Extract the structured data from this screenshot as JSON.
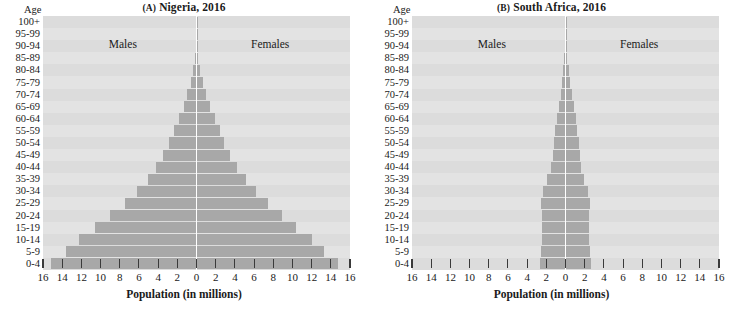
{
  "figure": {
    "x_axis_title": "Population (in millions)",
    "age_axis_title": "Age",
    "males_label": "Males",
    "females_label": "Females",
    "tick_labels": [
      "16",
      "14",
      "12",
      "10",
      "8",
      "6",
      "4",
      "2",
      "0",
      "2",
      "4",
      "6",
      "8",
      "10",
      "12",
      "14",
      "16"
    ],
    "tick_values": [
      -16,
      -14,
      -12,
      -10,
      -8,
      -6,
      -4,
      -2,
      0,
      2,
      4,
      6,
      8,
      10,
      12,
      14,
      16
    ],
    "age_groups": [
      "100+",
      "95-99",
      "90-94",
      "85-89",
      "80-84",
      "75-79",
      "70-74",
      "65-69",
      "60-64",
      "55-59",
      "50-54",
      "45-49",
      "40-44",
      "35-39",
      "30-34",
      "25-29",
      "20-24",
      "15-19",
      "10-14",
      "5-9",
      "0-4"
    ],
    "bar_color": "#a8a8a8",
    "row_color_a": "#dcdcdc",
    "row_color_b": "#e3e3e3",
    "centerline_color": "#ffffff"
  },
  "panels": [
    {
      "id": "nigeria",
      "label": "(A)",
      "title": "(A) Nigeria, 2016",
      "title_prefix": "(A)",
      "title_text": "Nigeria, 2016"
    },
    {
      "id": "south-africa",
      "label": "(B)",
      "title": "(B) South Africa, 2016",
      "title_prefix": "(B)",
      "title_text": "South Africa, 2016"
    }
  ],
  "chart_data": [
    {
      "type": "bar",
      "subtype": "population-pyramid",
      "title": "(A) Nigeria, 2016",
      "xlabel": "Population (in millions)",
      "ylabel": "Age",
      "xlim": [
        -16,
        16
      ],
      "xticks": [
        -16,
        -14,
        -12,
        -10,
        -8,
        -6,
        -4,
        -2,
        0,
        2,
        4,
        6,
        8,
        10,
        12,
        14,
        16
      ],
      "xticklabels": [
        "16",
        "14",
        "12",
        "10",
        "8",
        "6",
        "4",
        "2",
        "0",
        "2",
        "4",
        "6",
        "8",
        "10",
        "12",
        "14",
        "16"
      ],
      "grid": false,
      "legend": [
        "Males",
        "Females"
      ],
      "legend_position": "inside-top",
      "categories": [
        "100+",
        "95-99",
        "90-94",
        "85-89",
        "80-84",
        "75-79",
        "70-74",
        "65-69",
        "60-64",
        "55-59",
        "50-54",
        "45-49",
        "40-44",
        "35-39",
        "30-34",
        "25-29",
        "20-24",
        "15-19",
        "10-14",
        "5-9",
        "0-4"
      ],
      "series": [
        {
          "name": "Males",
          "values": [
            0.01,
            0.03,
            0.08,
            0.18,
            0.35,
            0.62,
            0.95,
            1.35,
            1.85,
            2.35,
            2.85,
            3.45,
            4.2,
            5.1,
            6.2,
            7.5,
            9.0,
            10.6,
            12.3,
            13.6,
            15.2
          ]
        },
        {
          "name": "Females",
          "values": [
            0.01,
            0.03,
            0.09,
            0.2,
            0.38,
            0.66,
            1.0,
            1.4,
            1.9,
            2.4,
            2.9,
            3.5,
            4.25,
            5.15,
            6.25,
            7.5,
            8.9,
            10.4,
            12.0,
            13.3,
            14.8
          ]
        }
      ]
    },
    {
      "type": "bar",
      "subtype": "population-pyramid",
      "title": "(B) South Africa, 2016",
      "xlabel": "Population (in millions)",
      "ylabel": "Age",
      "xlim": [
        -16,
        16
      ],
      "xticks": [
        -16,
        -14,
        -12,
        -10,
        -8,
        -6,
        -4,
        -2,
        0,
        2,
        4,
        6,
        8,
        10,
        12,
        14,
        16
      ],
      "xticklabels": [
        "16",
        "14",
        "12",
        "10",
        "8",
        "6",
        "4",
        "2",
        "0",
        "2",
        "4",
        "6",
        "8",
        "10",
        "12",
        "14",
        "16"
      ],
      "grid": false,
      "legend": [
        "Males",
        "Females"
      ],
      "legend_position": "inside-top",
      "categories": [
        "100+",
        "95-99",
        "90-94",
        "85-89",
        "80-84",
        "75-79",
        "70-74",
        "65-69",
        "60-64",
        "55-59",
        "50-54",
        "45-49",
        "40-44",
        "35-39",
        "30-34",
        "25-29",
        "20-24",
        "15-19",
        "10-14",
        "5-9",
        "0-4"
      ],
      "series": [
        {
          "name": "Males",
          "values": [
            0.005,
            0.02,
            0.06,
            0.13,
            0.24,
            0.35,
            0.5,
            0.65,
            0.85,
            1.05,
            1.2,
            1.35,
            1.55,
            1.9,
            2.3,
            2.6,
            2.5,
            2.45,
            2.5,
            2.55,
            2.7
          ]
        },
        {
          "name": "Females",
          "values": [
            0.01,
            0.04,
            0.1,
            0.2,
            0.35,
            0.5,
            0.68,
            0.85,
            1.05,
            1.25,
            1.4,
            1.5,
            1.62,
            1.95,
            2.3,
            2.6,
            2.5,
            2.45,
            2.5,
            2.55,
            2.7
          ]
        }
      ]
    }
  ]
}
